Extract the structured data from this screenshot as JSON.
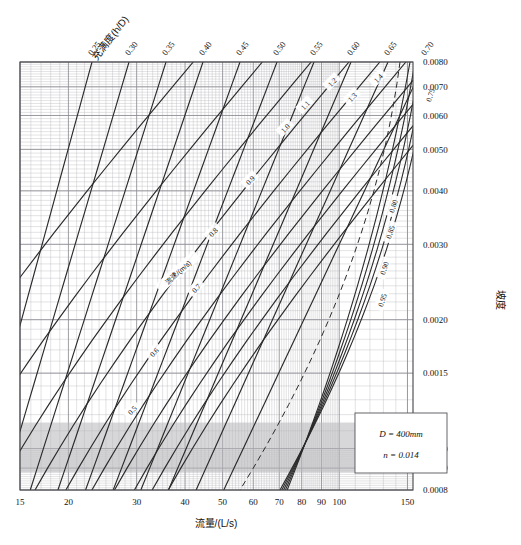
{
  "chart_data": {
    "type": "line",
    "title": "",
    "subtitle": "",
    "xlabel": "流量/(L/s)",
    "ylabel": "坡度",
    "top_axis_label": "充满度(h/D)",
    "inline_series_label": "流速/(m/s)",
    "xlim": [
      15,
      155
    ],
    "ylim": [
      0.0008,
      0.008
    ],
    "xscale": "log",
    "yscale": "log",
    "grid": true,
    "legend": "none",
    "x_ticks": [
      "15",
      "20",
      "30",
      "40",
      "50",
      "60",
      "70",
      "80",
      "90",
      "100",
      "150"
    ],
    "x_tick_values": [
      15,
      20,
      30,
      40,
      50,
      60,
      70,
      80,
      90,
      100,
      150
    ],
    "y_ticks": [
      "0.0080",
      "0.0070",
      "0.0060",
      "0.0050",
      "0.0040",
      "0.0030",
      "0.0020",
      "0.0015",
      "0.0010",
      "0.0009",
      "0.0008"
    ],
    "y_tick_values": [
      0.008,
      0.007,
      0.006,
      0.005,
      0.004,
      0.003,
      0.002,
      0.0015,
      0.001,
      0.0009,
      0.0008
    ],
    "top_ticks": [
      "0.25",
      "0.30",
      "0.35",
      "0.40",
      "0.45",
      "0.50",
      "0.55",
      "0.60",
      "0.65",
      "0.70"
    ],
    "top_tick_values": [
      0.25,
      0.3,
      0.35,
      0.4,
      0.45,
      0.5,
      0.55,
      0.6,
      0.65,
      0.7
    ],
    "series": [
      {
        "name": "流速 0.5",
        "label": "0.5",
        "kind": "velocity"
      },
      {
        "name": "流速 0.6",
        "label": "0.6",
        "kind": "velocity"
      },
      {
        "name": "流速 0.7",
        "label": "0.7",
        "kind": "velocity"
      },
      {
        "name": "流速 0.8",
        "label": "0.8",
        "kind": "velocity"
      },
      {
        "name": "流速 0.9",
        "label": "0.9",
        "kind": "velocity"
      },
      {
        "name": "流速 1.0",
        "label": "1.0",
        "kind": "velocity"
      },
      {
        "name": "流速 1.1",
        "label": "1.1",
        "kind": "velocity"
      },
      {
        "name": "流速 1.2",
        "label": "1.2",
        "kind": "velocity"
      },
      {
        "name": "流速 1.3",
        "label": "1.3",
        "kind": "velocity"
      },
      {
        "name": "流速 1.4",
        "label": "1.4",
        "kind": "velocity"
      },
      {
        "name": "充满度 0.75",
        "label": "0.75",
        "kind": "fill-ratio"
      },
      {
        "name": "充满度 0.80",
        "label": "0.80",
        "kind": "fill-ratio"
      },
      {
        "name": "充满度 0.85",
        "label": "0.85",
        "kind": "fill-ratio"
      },
      {
        "name": "充满度 0.90",
        "label": "0.90",
        "kind": "fill-ratio"
      },
      {
        "name": "充满度 0.95",
        "label": "0.95",
        "kind": "fill-ratio"
      }
    ],
    "velocity_labels": [
      "0.5",
      "0.6",
      "0.7",
      "0.8",
      "0.9",
      "1.0",
      "1.1",
      "1.2",
      "1.3",
      "1.4"
    ],
    "fill_ratio_labels": [
      "0.75",
      "0.80",
      "0.85",
      "0.90",
      "0.95"
    ],
    "annotations": {
      "box_line_1": "D = 400mm",
      "box_line_2": "n = 0.014"
    }
  },
  "note_box": {
    "diameter_symbol": "D",
    "diameter_value": "= 400mm",
    "roughness_symbol": "n",
    "roughness_value": "= 0.014"
  },
  "colors": {
    "grid_minor": "#b9b9bd",
    "grid_major": "#8d8d93",
    "curve": "#2a2a2a",
    "frame": "#444448",
    "band": "#b6b6ba",
    "background": "#ffffff"
  }
}
